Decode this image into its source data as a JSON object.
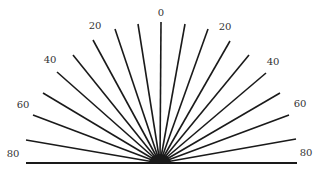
{
  "diagram": {
    "type": "angle-fan",
    "center": [
      160,
      163
    ],
    "color": "#1a1a1a",
    "rays": [
      {
        "angle": -80,
        "end": [
          26,
          140
        ]
      },
      {
        "angle": -70,
        "end": [
          33,
          115
        ]
      },
      {
        "angle": -60,
        "end": [
          43,
          93
        ]
      },
      {
        "angle": -50,
        "end": [
          57,
          72
        ]
      },
      {
        "angle": -40,
        "end": [
          73,
          55
        ]
      },
      {
        "angle": -30,
        "end": [
          93,
          40
        ]
      },
      {
        "angle": -20,
        "end": [
          115,
          29
        ]
      },
      {
        "angle": -10,
        "end": [
          138,
          24
        ]
      },
      {
        "angle": 0,
        "end": [
          161,
          22
        ]
      },
      {
        "angle": 10,
        "end": [
          185,
          24
        ]
      },
      {
        "angle": 20,
        "end": [
          208,
          29
        ]
      },
      {
        "angle": 30,
        "end": [
          230,
          41
        ]
      },
      {
        "angle": 40,
        "end": [
          249,
          55
        ]
      },
      {
        "angle": 50,
        "end": [
          266,
          73
        ]
      },
      {
        "angle": 60,
        "end": [
          280,
          93
        ]
      },
      {
        "angle": 70,
        "end": [
          289,
          115
        ]
      },
      {
        "angle": 80,
        "end": [
          296,
          139
        ]
      }
    ],
    "baseline": {
      "from": [
        26,
        163
      ],
      "to": [
        297,
        163
      ]
    },
    "labels": [
      {
        "text": "0",
        "pos": [
          161,
          12
        ]
      },
      {
        "text": "20",
        "pos": [
          95,
          25
        ]
      },
      {
        "text": "40",
        "pos": [
          50,
          59
        ]
      },
      {
        "text": "60",
        "pos": [
          23,
          104
        ]
      },
      {
        "text": "80",
        "pos": [
          13,
          153
        ]
      },
      {
        "text": "20",
        "pos": [
          225,
          26
        ]
      },
      {
        "text": "40",
        "pos": [
          273,
          61
        ]
      },
      {
        "text": "60",
        "pos": [
          300,
          103
        ]
      },
      {
        "text": "80",
        "pos": [
          306,
          152
        ]
      }
    ]
  }
}
